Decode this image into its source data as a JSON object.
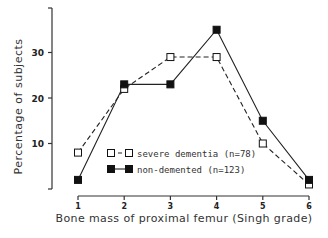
{
  "chart_data": {
    "type": "line",
    "title": "",
    "xlabel": "Bone mass of proximal femur (Singh grade)",
    "ylabel": "Percentage of subjects",
    "x": [
      1,
      2,
      3,
      4,
      5,
      6
    ],
    "x_ticks": [
      "1",
      "2",
      "3",
      "4",
      "5",
      "6"
    ],
    "y_ticks": [
      "10",
      "20",
      "30"
    ],
    "ylim": [
      0,
      40
    ],
    "xlim": [
      1,
      6
    ],
    "grid": false,
    "legend_position": "lower center (inside plot)",
    "series": [
      {
        "name": "severe dementia (n=78)",
        "marker": "open-square",
        "line": "dashed",
        "values": [
          8,
          22,
          29,
          29,
          10,
          1
        ]
      },
      {
        "name": "non-demented (n=123)",
        "marker": "filled-square",
        "line": "solid",
        "values": [
          2,
          23,
          23,
          35,
          15,
          2
        ]
      }
    ]
  }
}
